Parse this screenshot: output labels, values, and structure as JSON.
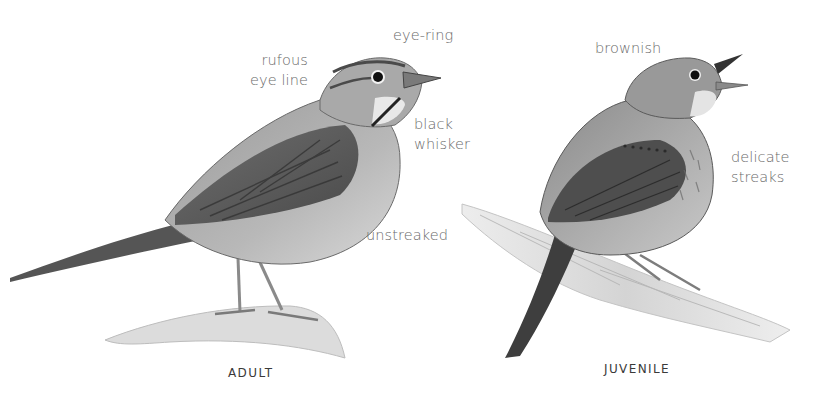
{
  "figure": {
    "adult": {
      "caption": "ADULT",
      "labels": {
        "eye_line": [
          "rufous",
          "eye line"
        ],
        "eye_ring": "eye-ring",
        "whisker": [
          "black",
          "whisker"
        ],
        "underparts": "unstreaked"
      }
    },
    "juvenile": {
      "caption": "JUVENILE",
      "labels": {
        "color": "brownish",
        "streaks": [
          "delicate",
          "streaks"
        ]
      }
    },
    "colors": {
      "background": "#ffffff",
      "label_text": "#6a6a6a",
      "caption_text": "#3a3a3a"
    }
  }
}
